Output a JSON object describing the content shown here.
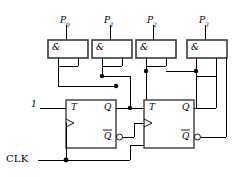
{
  "diagram": {
    "background_color": "#ffffff",
    "line_color": "#000000",
    "box_stroke_color": "#3a3a3a"
  },
  "outputs": [
    {
      "id": "p0",
      "label": "P",
      "subscript": "0"
    },
    {
      "id": "p1",
      "label": "P",
      "subscript": "1"
    },
    {
      "id": "p2",
      "label": "P",
      "subscript": "2"
    },
    {
      "id": "p3",
      "label": "P",
      "subscript": "3"
    }
  ],
  "gates": [
    {
      "id": "and0",
      "symbol": "&",
      "output_label": "P0"
    },
    {
      "id": "and1",
      "symbol": "&",
      "output_label": "P1"
    },
    {
      "id": "and2",
      "symbol": "&",
      "output_label": "P2"
    },
    {
      "id": "and3",
      "symbol": "&",
      "output_label": "P3"
    }
  ],
  "flipflops": [
    {
      "id": "ff0",
      "t_label": "T",
      "q_label": "Q",
      "qbar_label": "Q",
      "clock_symbol": "edge-triggered"
    },
    {
      "id": "ff1",
      "t_label": "T",
      "q_label": "Q",
      "qbar_label": "Q",
      "clock_symbol": "edge-triggered"
    }
  ],
  "inputs": {
    "constant_one": "1",
    "clock": "CLK"
  }
}
